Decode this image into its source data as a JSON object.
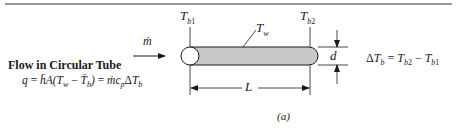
{
  "figure": {
    "title": "Flow in Circular Tube",
    "equation": {
      "lhs": "q",
      "eq1": "=",
      "h": "h̄",
      "A": "A(",
      "Tw": "T",
      "Tw_sub": "w",
      "minus": "−",
      "Tb": "T̄",
      "Tb_sub": "b",
      "close": ")",
      "eq2": "=",
      "mdot": "ṁc",
      "cp_sub": "p",
      "delta": "Δ",
      "dT": "T",
      "dT_sub": "b"
    },
    "labels": {
      "mass_flow": "ṁ",
      "Tb1": "T",
      "Tb1_sub": "b",
      "Tb1_idx": "1",
      "Tb2": "T",
      "Tb2_sub": "b",
      "Tb2_idx": "2",
      "Tw": "T",
      "Tw_sub": "w",
      "diameter": "d",
      "length": "L"
    },
    "delta_relation": {
      "delta": "Δ",
      "T": "T",
      "sub": "b",
      "eq": "=",
      "Tb2": "T",
      "Tb2_sub": "b",
      "Tb2_idx": "2",
      "minus": "−",
      "Tb1": "T",
      "Tb1_sub": "b",
      "Tb1_idx": "1"
    },
    "caption": "(a)",
    "colors": {
      "tube_fill": "#c8c8c8",
      "stroke": "#1a1a1a",
      "rule": "#9a9a9a"
    }
  }
}
